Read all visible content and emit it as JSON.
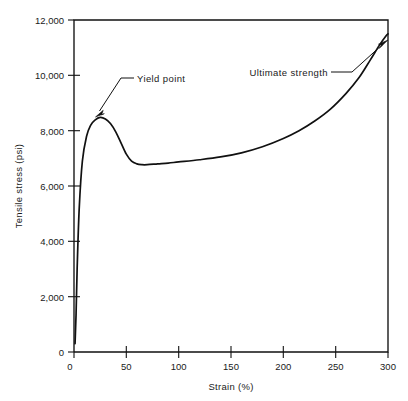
{
  "chart_data": {
    "type": "line",
    "title": "",
    "xlabel": "Strain (%)",
    "ylabel": "Tensile stress (psi)",
    "xlim": [
      0,
      300
    ],
    "ylim": [
      0,
      12000
    ],
    "grid": false,
    "legend": null,
    "xticks": [
      0,
      50,
      100,
      150,
      200,
      250,
      300
    ],
    "xtick_labels": [
      "0",
      "50",
      "100",
      "150",
      "200",
      "250",
      "300"
    ],
    "yticks": [
      0,
      2000,
      4000,
      6000,
      8000,
      10000,
      12000
    ],
    "ytick_labels": [
      "0",
      "2,000",
      "4,000",
      "6,000",
      "8,000",
      "10,000",
      "12,000"
    ],
    "series": [
      {
        "name": "stress-strain curve",
        "x": [
          1,
          2,
          3,
          5,
          8,
          12,
          16,
          20,
          25,
          30,
          35,
          40,
          45,
          50,
          55,
          60,
          65,
          70,
          80,
          90,
          100,
          120,
          140,
          160,
          180,
          200,
          215,
          230,
          245,
          260,
          272,
          283,
          292,
          298,
          300
        ],
        "y": [
          300,
          1400,
          3000,
          5200,
          6900,
          7800,
          8200,
          8380,
          8480,
          8420,
          8250,
          7950,
          7550,
          7150,
          6900,
          6800,
          6770,
          6770,
          6800,
          6830,
          6870,
          6950,
          7050,
          7200,
          7420,
          7720,
          8000,
          8350,
          8780,
          9350,
          9900,
          10550,
          11100,
          11420,
          11500
        ]
      }
    ],
    "annotations": [
      {
        "label": "Yield point",
        "points_to_x": 28,
        "points_to_y": 8480,
        "text_x": 60,
        "text_y": 10000
      },
      {
        "label": "Ultimate strength",
        "points_to_x": 299,
        "points_to_y": 11480,
        "text_x": 183,
        "text_y": 10600
      }
    ]
  },
  "axes": {
    "x_axis_title": "Strain (%)",
    "y_axis_title": "Tensile stress (psi)"
  },
  "annotations": {
    "yield_point_label": "Yield point",
    "ultimate_strength_label": "Ultimate strength"
  },
  "colors": {
    "ink": "#111111",
    "background": "#ffffff"
  }
}
